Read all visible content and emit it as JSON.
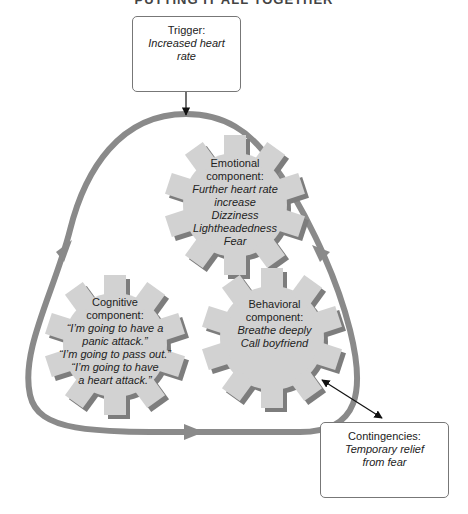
{
  "title": "PUTTING IT ALL TOGETHER",
  "trigger": {
    "heading": "Trigger:",
    "lines": [
      "Increased heart",
      "rate"
    ]
  },
  "emotional": {
    "heading": [
      "Emotional",
      "component:"
    ],
    "items": [
      "Further heart rate",
      "increase",
      "Dizziness",
      "Lightheadedness",
      "Fear"
    ]
  },
  "cognitive": {
    "heading": [
      "Cognitive",
      "component:"
    ],
    "items": [
      "“I’m going to have a",
      "panic attack.”",
      "“I’m going to pass out.”",
      "“I’m going to have",
      "a heart attack.”"
    ]
  },
  "behavioral": {
    "heading": [
      "Behavioral",
      "component:"
    ],
    "items": [
      "Breathe deeply",
      "Call boyfriend"
    ]
  },
  "contingencies": {
    "heading": "Contingencies:",
    "lines": [
      "Temporary relief",
      "from fear"
    ]
  },
  "colors": {
    "loop": "#8a8a8a",
    "gear_fill": "#d2d2d2",
    "gear_shadow": "#7d7d7d",
    "box_border": "#777777"
  }
}
